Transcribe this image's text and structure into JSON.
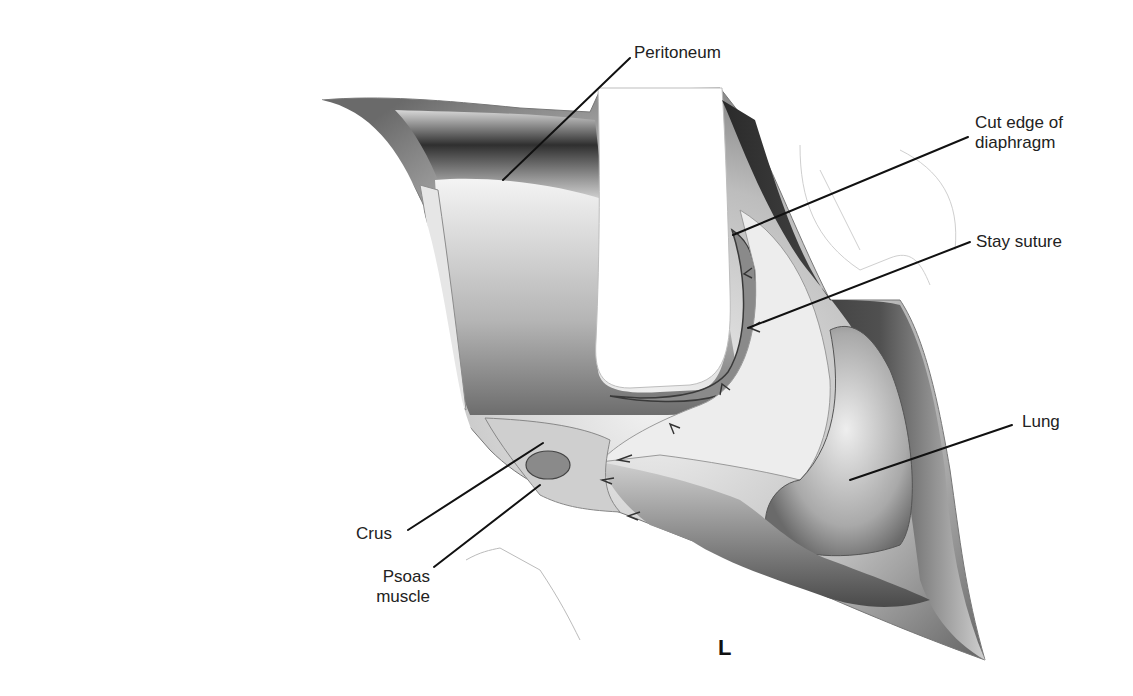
{
  "figure": {
    "view_label": "L",
    "labels": [
      {
        "id": "peritoneum",
        "text": "Peritoneum",
        "x": 633,
        "y": 44,
        "line": [
          630,
          58,
          503,
          180
        ]
      },
      {
        "id": "cut-edge-diaphragm",
        "text": "Cut edge of\ndiaphragm",
        "x": 975,
        "y": 114,
        "line": [
          968,
          137,
          733,
          235
        ]
      },
      {
        "id": "stay-suture",
        "text": "Stay suture",
        "x": 975,
        "y": 232,
        "line": [
          970,
          242,
          748,
          328
        ]
      },
      {
        "id": "lung",
        "text": "Lung",
        "x": 1022,
        "y": 412,
        "line": [
          1012,
          425,
          850,
          480
        ]
      },
      {
        "id": "crus",
        "text": "Crus",
        "x": 358,
        "y": 524,
        "line": [
          408,
          530,
          543,
          443
        ]
      },
      {
        "id": "psoas-muscle",
        "text": "Psoas\nmuscle",
        "x": 364,
        "y": 567,
        "line": [
          434,
          567,
          540,
          485
        ]
      }
    ],
    "colors": {
      "background": "#ffffff",
      "line": "#111111",
      "tissue_dark": "#3a3a3a",
      "tissue_mid": "#8a8a8a",
      "tissue_light": "#d6d6d6"
    }
  }
}
